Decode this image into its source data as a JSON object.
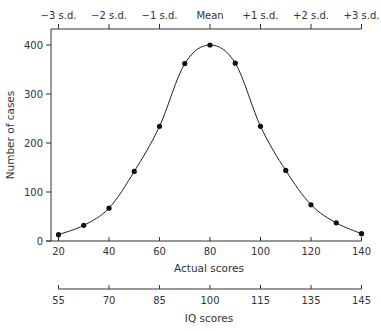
{
  "chart_data": {
    "type": "line",
    "title": "",
    "xlabel": "Actual scores",
    "ylabel": "Number of cases",
    "xlim": [
      20,
      140
    ],
    "ylim": [
      0,
      400
    ],
    "x_ticks": [
      20,
      40,
      60,
      80,
      100,
      120,
      140
    ],
    "y_ticks": [
      0,
      100,
      200,
      300,
      400
    ],
    "top_axis": {
      "label": "",
      "ticks": [
        {
          "x": 20,
          "label": "−3 s.d."
        },
        {
          "x": 40,
          "label": "−2 s.d."
        },
        {
          "x": 60,
          "label": "−1 s.d."
        },
        {
          "x": 80,
          "label": "Mean"
        },
        {
          "x": 100,
          "label": "+1 s.d."
        },
        {
          "x": 120,
          "label": "+2 s.d."
        },
        {
          "x": 140,
          "label": "+3 s.d."
        }
      ]
    },
    "secondary_bottom_axis": {
      "label": "IQ scores",
      "ticks": [
        {
          "x": 20,
          "label": "55"
        },
        {
          "x": 40,
          "label": "70"
        },
        {
          "x": 60,
          "label": "85"
        },
        {
          "x": 80,
          "label": "100"
        },
        {
          "x": 100,
          "label": "115"
        },
        {
          "x": 120,
          "label": "135"
        },
        {
          "x": 140,
          "label": "145"
        }
      ]
    },
    "grid": false,
    "legend": null,
    "series": [
      {
        "name": "Number of cases",
        "x": [
          20,
          30,
          40,
          50,
          60,
          70,
          80,
          90,
          100,
          110,
          120,
          130,
          140
        ],
        "values": [
          13,
          32,
          67,
          142,
          234,
          362,
          400,
          363,
          234,
          144,
          74,
          37,
          15
        ],
        "markers": true,
        "smooth": true,
        "color": "#111111"
      }
    ]
  }
}
